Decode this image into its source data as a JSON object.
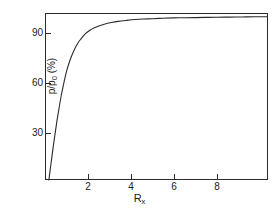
{
  "chart_data": {
    "type": "line",
    "title": "",
    "xlabel": "Rx",
    "xlabel_base": "R",
    "xlabel_sub": "x",
    "ylabel": "p/p0 (%)",
    "ylabel_num": "p/p",
    "ylabel_sub": "0",
    "ylabel_unit": " (%)",
    "xlim": [
      0,
      10.4
    ],
    "ylim": [
      0,
      102
    ],
    "xticks": [
      2,
      4,
      6,
      8
    ],
    "xtick_labels": [
      "2",
      "4",
      "6",
      "8"
    ],
    "yticks": [
      30,
      60,
      90
    ],
    "ytick_labels": [
      "30",
      "60",
      "90"
    ],
    "grid": false,
    "legend": "none",
    "line_color": "#2b2b2b",
    "series": [
      {
        "name": "p/p0 vs Rx",
        "x": [
          0.18,
          0.25,
          0.35,
          0.45,
          0.55,
          0.65,
          0.75,
          0.85,
          0.95,
          1.05,
          1.15,
          1.25,
          1.4,
          1.55,
          1.7,
          1.9,
          2.1,
          2.3,
          2.5,
          2.8,
          3.1,
          3.4,
          3.8,
          4.2,
          4.6,
          5.0,
          5.5,
          6.0,
          6.5,
          7.0,
          7.5,
          8.0,
          8.6,
          9.2,
          9.8,
          10.35
        ],
        "y": [
          0.0,
          7.0,
          17.0,
          26.5,
          35.5,
          43.5,
          51.0,
          57.5,
          63.5,
          68.5,
          72.5,
          76.0,
          80.5,
          84.0,
          86.5,
          89.5,
          91.5,
          93.0,
          94.0,
          95.3,
          96.2,
          96.9,
          97.5,
          98.0,
          98.3,
          98.5,
          98.8,
          99.0,
          99.1,
          99.2,
          99.3,
          99.4,
          99.5,
          99.6,
          99.7,
          99.75
        ]
      }
    ]
  }
}
